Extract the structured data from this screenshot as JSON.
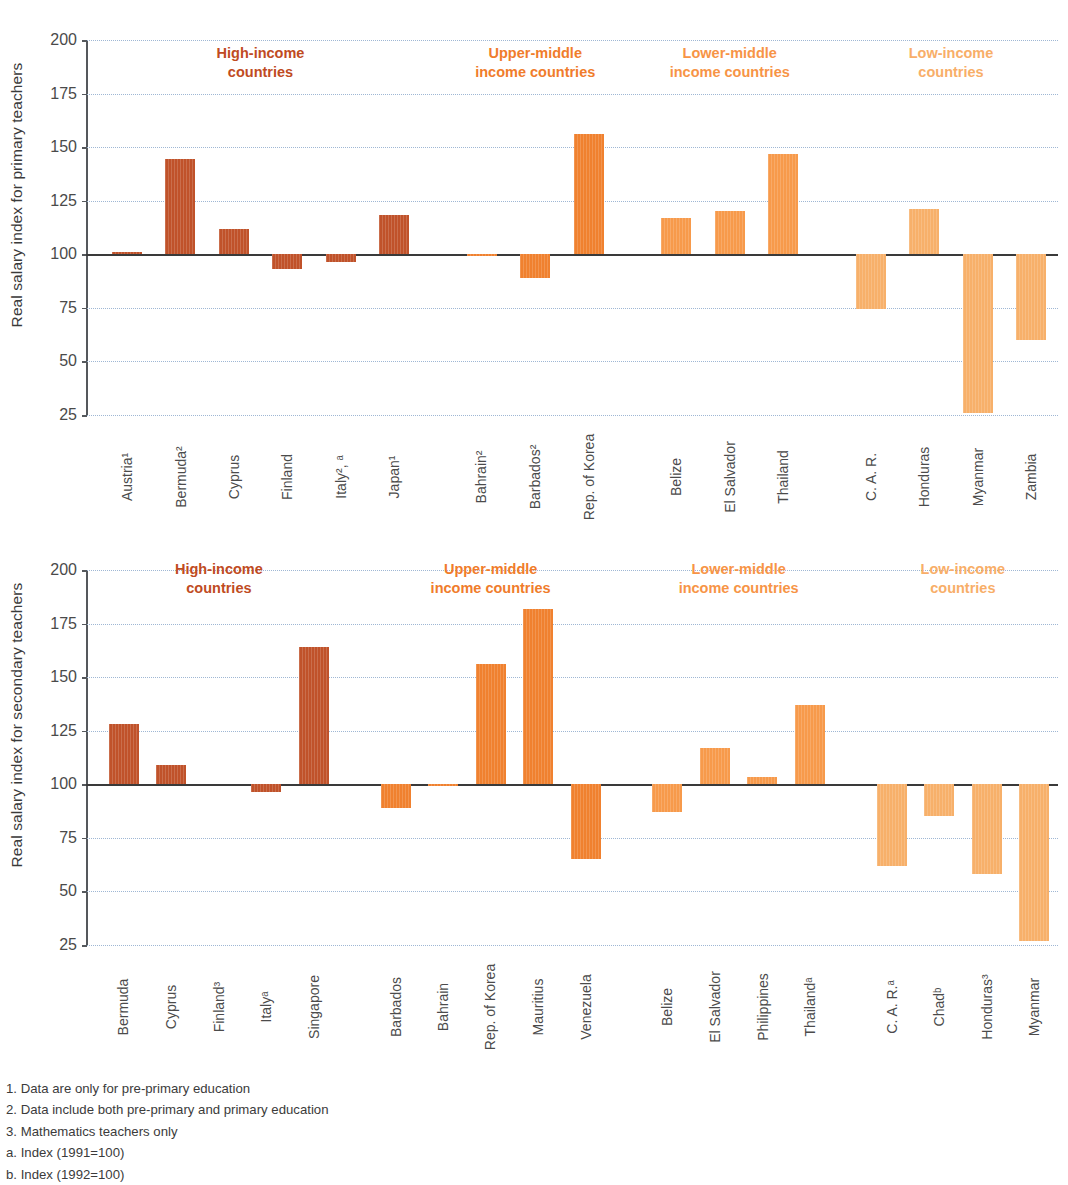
{
  "colors": {
    "bar_high": "#C0522A",
    "bar_upper": "#F0812F",
    "bar_lower": "#F79A4B",
    "bar_low": "#F7B06A",
    "head_high": "#BF4B22",
    "head_upper": "#F07C2B",
    "head_lower": "#F79446",
    "head_low": "#F8AE68",
    "grid": "#9FB7D4",
    "axis": "#55585C"
  },
  "yaxis": {
    "ticks": [
      200,
      175,
      150,
      125,
      100,
      75,
      50,
      25
    ],
    "min": 25,
    "max": 200
  },
  "group_headers": [
    {
      "label": "High-income\ncountries",
      "color_key": "head_high"
    },
    {
      "label": "Upper-middle\nincome countries",
      "color_key": "head_upper"
    },
    {
      "label": "Lower-middle\nincome countries",
      "color_key": "head_lower"
    },
    {
      "label": "Low-income\ncountries",
      "color_key": "head_low"
    }
  ],
  "chart_data": [
    {
      "type": "bar",
      "id": "primary",
      "title": "",
      "ylabel": "Real salary index for primary teachers",
      "xlabel": "",
      "ylim": [
        25,
        200
      ],
      "baseline": 100,
      "grid": true,
      "legend": "none",
      "group_labels": [
        "High-income\ncountries",
        "Upper-middle\nincome countries",
        "Lower-middle\nincome countries",
        "Low-income\ncountries"
      ],
      "groups": [
        {
          "name": "High-income countries",
          "color": "#C0522A",
          "categories": [
            "Austria¹",
            "Bermuda²",
            "Cyprus",
            "Finland",
            "Italy², ᵃ",
            "Japan¹"
          ],
          "values": [
            101,
            144.5,
            112,
            93,
            96.5,
            118.5
          ]
        },
        {
          "name": "Upper-middle income countries",
          "color": "#F0812F",
          "categories": [
            "Bahrain²",
            "Barbados²",
            "Rep. of Korea"
          ],
          "values": [
            99,
            89,
            156
          ]
        },
        {
          "name": "Lower-middle income countries",
          "color": "#F79A4B",
          "categories": [
            "Belize",
            "El Salvador",
            "Thailand"
          ],
          "values": [
            117,
            120,
            147
          ]
        },
        {
          "name": "Low-income countries",
          "color": "#F7B06A",
          "categories": [
            "C. A. R.",
            "Honduras",
            "Myanmar",
            "Zambia"
          ],
          "values": [
            74.5,
            121,
            26,
            60
          ]
        }
      ]
    },
    {
      "type": "bar",
      "id": "secondary",
      "title": "",
      "ylabel": "Real salary index for secondary teachers",
      "xlabel": "",
      "ylim": [
        25,
        200
      ],
      "baseline": 100,
      "grid": true,
      "legend": "none",
      "group_labels": [
        "High-income\ncountries",
        "Upper-middle\nincome countries",
        "Lower-middle\nincome countries",
        "Low-income\ncountries"
      ],
      "groups": [
        {
          "name": "High-income countries",
          "color": "#C0522A",
          "categories": [
            "Bermuda",
            "Cyprus",
            "Finland³",
            "Italyᵃ",
            "Singapore"
          ],
          "values": [
            128,
            109,
            null,
            96.5,
            164
          ]
        },
        {
          "name": "Upper-middle income countries",
          "color": "#F0812F",
          "categories": [
            "Barbados",
            "Bahrain",
            "Rep. of Korea",
            "Mauritius",
            "Venezuela"
          ],
          "values": [
            89,
            99,
            156,
            182,
            65
          ]
        },
        {
          "name": "Lower-middle income countries",
          "color": "#F79A4B",
          "categories": [
            "Belize",
            "El Salvador",
            "Philippines",
            "Thailandᵃ"
          ],
          "values": [
            87,
            117,
            103.5,
            137
          ]
        },
        {
          "name": "Low-income countries",
          "color": "#F7B06A",
          "categories": [
            "C. A. R.ᵃ",
            "Chadᵇ",
            "Honduras³",
            "Myanmar"
          ],
          "values": [
            62,
            85,
            58,
            27
          ]
        }
      ]
    }
  ],
  "footnotes": [
    "1. Data are only for pre-primary education",
    "2. Data include both pre-primary and primary education",
    "3. Mathematics teachers only",
    "a. Index (1991=100)",
    "b. Index (1992=100)"
  ]
}
